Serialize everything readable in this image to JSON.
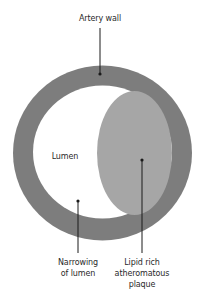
{
  "diagram": {
    "labels": {
      "artery_wall": "Artery wall",
      "lumen": "Lumen",
      "narrowing_line1": "Narrowing",
      "narrowing_line2": "of lumen",
      "plaque_line1": "Lipid rich",
      "plaque_line2": "atheromatous",
      "plaque_line3": "plaque"
    },
    "colors": {
      "artery_wall": "#7d7d7d",
      "lumen": "#ffffff",
      "plaque": "#a6a6a6",
      "leader": "#1a1a1a",
      "text": "#2a2a2a"
    }
  }
}
